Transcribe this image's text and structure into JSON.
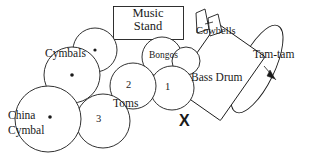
{
  "diagram": {
    "labels": {
      "music_stand_line1": "Music",
      "music_stand_line2": "Stand",
      "cowbells": "Cowbells",
      "tam_tam": "Tam-tam",
      "bongos": "Bongos",
      "bass_drum": "Bass Drum",
      "cymbals": "Cymbals",
      "toms": "Toms",
      "china_line1": "China",
      "china_line2": "Cymbal",
      "tom_1": "1",
      "tom_2": "2",
      "tom_3": "3",
      "player_position": "X"
    },
    "colors": {
      "stroke": "#1a1a1a",
      "fill": "#ffffff",
      "text": "#1a1a1a",
      "background": "#ffffff"
    }
  }
}
